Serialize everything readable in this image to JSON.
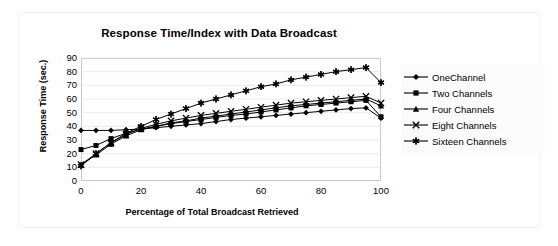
{
  "chart_data": {
    "type": "line",
    "title": "Response Time/Index with Data Broadcast",
    "xlabel": "Percentage of Total Broadcast Retrieved",
    "ylabel": "Response Time (sec.)",
    "xlim": [
      0,
      100
    ],
    "ylim": [
      0,
      90
    ],
    "xticks": [
      0,
      20,
      40,
      60,
      80,
      100
    ],
    "yticks": [
      0,
      10,
      20,
      30,
      40,
      50,
      60,
      70,
      80,
      90
    ],
    "grid": "horizontal",
    "legend_position": "right",
    "x": [
      0,
      5,
      10,
      15,
      20,
      25,
      30,
      35,
      40,
      45,
      50,
      55,
      60,
      65,
      70,
      75,
      80,
      85,
      90,
      95,
      100
    ],
    "series": [
      {
        "name": "OneChannel",
        "marker": "diamond",
        "color": "#000000",
        "values": [
          37,
          37,
          37,
          37.5,
          38,
          39,
          40,
          41,
          42,
          43.5,
          45,
          46,
          47,
          48,
          49,
          50,
          51,
          52,
          53,
          53.5,
          46
        ]
      },
      {
        "name": "Two Channels",
        "marker": "square",
        "color": "#000000",
        "values": [
          23,
          26,
          31,
          35,
          38,
          40,
          42,
          43.5,
          45,
          46.5,
          48,
          49,
          50.5,
          52,
          53.5,
          55,
          56,
          57,
          58,
          59,
          47
        ]
      },
      {
        "name": "Four Channels",
        "marker": "triangle",
        "color": "#000000",
        "values": [
          12,
          19,
          27,
          33,
          37.5,
          40,
          42.5,
          44,
          46,
          47.5,
          49,
          50.5,
          52,
          53.5,
          55,
          56,
          57,
          58,
          59,
          60,
          55
        ]
      },
      {
        "name": "Eight Channels",
        "marker": "cross",
        "color": "#000000",
        "values": [
          12,
          20,
          28,
          34,
          38.5,
          41.5,
          44,
          46,
          48,
          49.5,
          51,
          52.5,
          54,
          55.5,
          57,
          58,
          59,
          60,
          61,
          62,
          57
        ]
      },
      {
        "name": "Sixteen Channels",
        "marker": "star",
        "color": "#000000",
        "values": [
          11,
          20,
          28,
          35,
          40,
          45,
          49,
          53,
          57,
          60,
          63,
          66,
          69,
          71,
          74,
          76,
          78,
          80,
          81.5,
          83,
          72
        ]
      }
    ]
  }
}
